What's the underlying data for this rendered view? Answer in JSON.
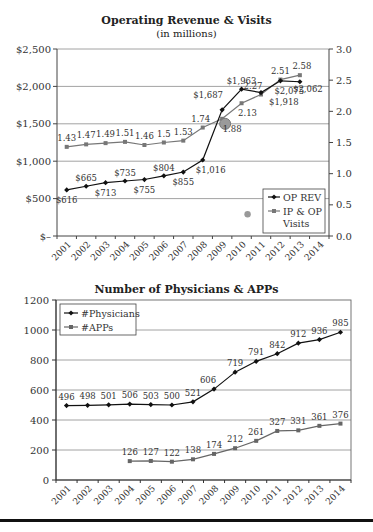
{
  "chart_data": [
    {
      "type": "line",
      "title": "Operating Revenue & Visits",
      "subtitle": "(in millions)",
      "xlabel": "",
      "ylabel": "",
      "categories": [
        "2001",
        "2002",
        "2003",
        "2004",
        "2005",
        "2006",
        "2007",
        "2008",
        "2009",
        "2010",
        "2011",
        "2012",
        "2013",
        "2014"
      ],
      "y_left": {
        "ticks": [
          "$2,500",
          "$2,000",
          "$1,500",
          "$1,000",
          "$500",
          "$–"
        ],
        "range": [
          0,
          2500
        ]
      },
      "y_right": {
        "ticks": [
          "3.0",
          "2.5",
          "2.0",
          "1.5",
          "1.0",
          "0.5",
          "0.0"
        ],
        "range": [
          0,
          3.0
        ]
      },
      "grid": true,
      "legend_position": "lower-right inside",
      "series": [
        {
          "name": "OP REV",
          "axis": "left",
          "marker": "diamond",
          "color": "#111111",
          "values": [
            616,
            665,
            713,
            735,
            755,
            804,
            855,
            1016,
            1687,
            1963,
            1918,
            2075,
            2062,
            null
          ],
          "labels": [
            "$616",
            "$665",
            "$713",
            "$735",
            "$755",
            "$804",
            "$855",
            "$1,016",
            "$1,687",
            "$1,963",
            "$1,918",
            "$2,075",
            "$2,062",
            ""
          ]
        },
        {
          "name": "IP & OP Visits",
          "axis": "right",
          "marker": "square",
          "color": "#777777",
          "values": [
            1.43,
            1.47,
            1.49,
            1.51,
            1.46,
            1.5,
            1.53,
            1.74,
            1.88,
            2.13,
            2.27,
            2.51,
            2.58,
            null
          ],
          "labels": [
            "1.43",
            "1.47",
            "1.49",
            "1.51",
            "1.46",
            "1.5",
            "1.53",
            "1.74",
            "1.88",
            "2.13",
            "2.27",
            "2.51",
            "2.58",
            ""
          ]
        }
      ],
      "annotations": [
        "grey circle marker near 2009 on OP REV line",
        "grey dot near 2010 at ~0.35 on right axis"
      ]
    },
    {
      "type": "line",
      "title": "Number of Physicians & APPs",
      "xlabel": "",
      "ylabel": "",
      "categories": [
        "2001",
        "2002",
        "2003",
        "2004",
        "2005",
        "2006",
        "2007",
        "2008",
        "2009",
        "2010",
        "2011",
        "2012",
        "2013",
        "2014"
      ],
      "y": {
        "ticks": [
          "1200",
          "1000",
          "800",
          "600",
          "400",
          "200",
          "0"
        ],
        "range": [
          0,
          1200
        ]
      },
      "grid": true,
      "legend_position": "upper-left inside",
      "series": [
        {
          "name": "#Physicians",
          "marker": "diamond",
          "color": "#111111",
          "values": [
            496,
            498,
            501,
            506,
            503,
            500,
            521,
            606,
            719,
            791,
            842,
            912,
            936,
            985
          ]
        },
        {
          "name": "#APPs",
          "marker": "square",
          "color": "#666666",
          "values": [
            null,
            null,
            null,
            126,
            127,
            122,
            138,
            174,
            212,
            261,
            327,
            331,
            361,
            376
          ]
        }
      ]
    }
  ],
  "chart1": {
    "title": "Operating Revenue & Visits",
    "subtitle": "(in millions)",
    "legend": {
      "op_rev": "OP REV",
      "visits_line1": "IP & OP",
      "visits_line2": "Visits"
    }
  },
  "chart2": {
    "title": "Number of Physicians & APPs",
    "legend": {
      "physicians": "#Physicians",
      "apps": "#APPs"
    }
  },
  "footer": {
    "fragment": ""
  }
}
